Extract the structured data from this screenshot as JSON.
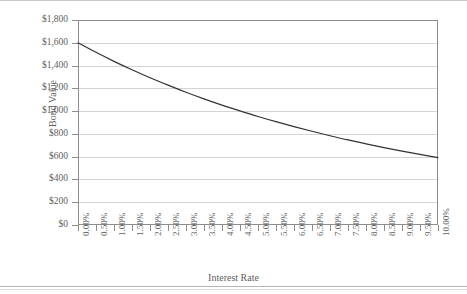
{
  "chart_data": {
    "type": "line",
    "title": "",
    "xlabel": "Interest Rate",
    "ylabel": "Bond Value",
    "xlim": [
      0,
      10
    ],
    "ylim": [
      0,
      1800
    ],
    "grid": true,
    "legend": "none",
    "x_tick_labels": [
      "0.00%",
      "0.50%",
      "1.00%",
      "1.50%",
      "2.00%",
      "2.50%",
      "3.00%",
      "3.50%",
      "4.00%",
      "4.50%",
      "5.00%",
      "5.50%",
      "6.00%",
      "6.50%",
      "7.00%",
      "7.50%",
      "8.00%",
      "8.50%",
      "9.00%",
      "9.50%",
      "10.00%"
    ],
    "y_tick_labels": [
      "$0",
      "$200",
      "$400",
      "$600",
      "$800",
      "$1,000",
      "$1,200",
      "$1,400",
      "$1,600",
      "$1,800"
    ],
    "y_tick_values": [
      0,
      200,
      400,
      600,
      800,
      1000,
      1200,
      1400,
      1600,
      1800
    ],
    "series": [
      {
        "name": "Bond Value",
        "color": "#333333",
        "x": [
          0,
          0.5,
          1,
          1.5,
          2,
          2.5,
          3,
          3.5,
          4,
          4.5,
          5,
          5.5,
          6,
          6.5,
          7,
          7.5,
          8,
          8.5,
          9,
          9.5,
          10
        ],
        "values": [
          1600,
          1516,
          1437,
          1363,
          1293,
          1228,
          1166,
          1108,
          1053,
          1002,
          953,
          907,
          864,
          823,
          784,
          747,
          713,
          680,
          649,
          620,
          592
        ]
      }
    ]
  },
  "axes": {
    "y_title": "Bond Value",
    "x_title": "Interest Rate"
  }
}
